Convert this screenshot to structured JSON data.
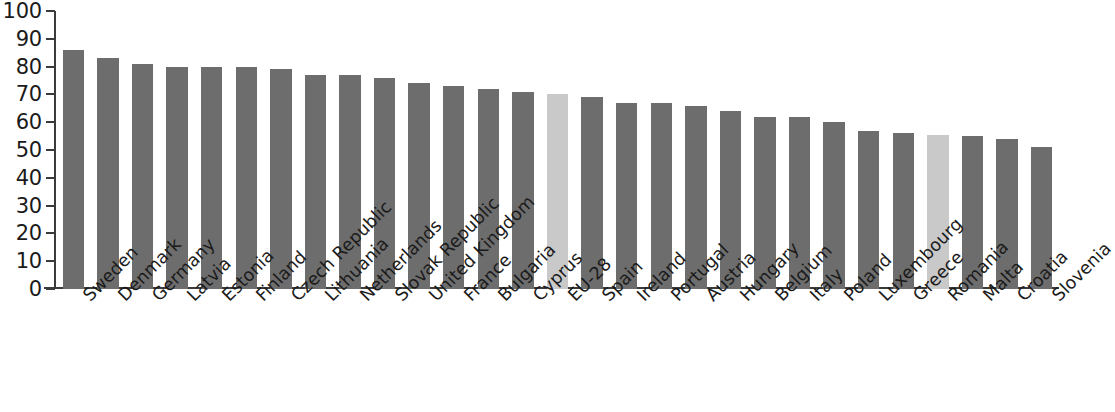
{
  "chart_data": {
    "type": "bar",
    "title": "",
    "subtitle": "",
    "xlabel": "",
    "ylabel": "",
    "ylim": [
      0,
      100
    ],
    "ytick_labels": [
      "100",
      "90",
      "80",
      "70",
      "60",
      "50",
      "40",
      "30",
      "20",
      "10",
      "0"
    ],
    "ytick_values": [
      100,
      90,
      80,
      70,
      60,
      50,
      40,
      30,
      20,
      10,
      0
    ],
    "grid": false,
    "legend": "none",
    "categories": [
      "Sweden",
      "Denmark",
      "Germany",
      "Latvia",
      "Estonia",
      "Finland",
      "Czech Republic",
      "Lithuania",
      "Netherlands",
      "Slovak Republic",
      "United Kingdom",
      "France",
      "Bulgaria",
      "Cyprus",
      "EU-28",
      "Spain",
      "Ireland",
      "Portugal",
      "Austria",
      "Hungary",
      "Belgium",
      "Italy",
      "Poland",
      "Luxembourg",
      "Greece",
      "Romania",
      "Malta",
      "Croatia",
      "Slovenia"
    ],
    "values": [
      86,
      83,
      81,
      80,
      80,
      80,
      79,
      77,
      77,
      76,
      74,
      73,
      72,
      71,
      70,
      69,
      67,
      67,
      66,
      64,
      62,
      62,
      60,
      57,
      56,
      55.5,
      55,
      54,
      51
    ],
    "highlighted_categories": [
      "EU-28",
      "Romania"
    ],
    "colors": {
      "bar_default": "#6d6d6d",
      "bar_highlight": "#c9c9c9",
      "axis": "#3b3b3b",
      "text": "#1a1a1a",
      "background": "#ffffff"
    }
  }
}
